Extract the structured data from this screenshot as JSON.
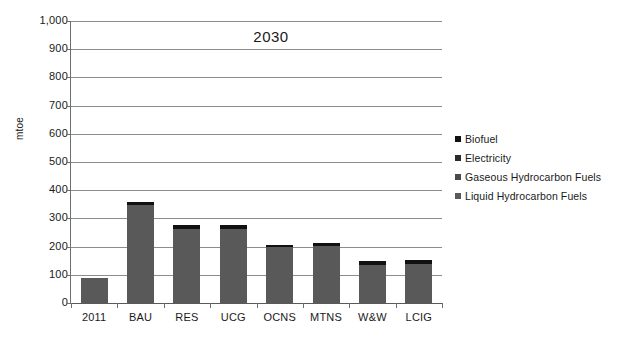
{
  "chart_data": {
    "type": "bar",
    "title": "2030",
    "xlabel": "",
    "ylabel": "mtoe",
    "ylim": [
      0,
      1000
    ],
    "ytick_step": 100,
    "grid": true,
    "legend_position": "right",
    "stacked": true,
    "categories": [
      "2011",
      "BAU",
      "RES",
      "UCG",
      "OCNS",
      "MTNS",
      "W&W",
      "LCIG"
    ],
    "ytick_labels": [
      "1,000",
      "900",
      "800",
      "700",
      "600",
      "500",
      "400",
      "300",
      "200",
      "100",
      "0"
    ],
    "ytick_values": [
      1000,
      900,
      800,
      700,
      600,
      500,
      400,
      300,
      200,
      100,
      0
    ],
    "series": [
      {
        "name": "Biofuel",
        "color": "#111111",
        "values": [
          0,
          10,
          14,
          14,
          7,
          9,
          12,
          12
        ]
      },
      {
        "name": "Electricity",
        "color": "#2b2b2b",
        "values": [
          0,
          0,
          0,
          0,
          0,
          0,
          0,
          0
        ]
      },
      {
        "name": "Gaseous Hydrocarbon Fuels",
        "color": "#4a4a4a",
        "values": [
          0,
          0,
          0,
          0,
          0,
          0,
          0,
          0
        ]
      },
      {
        "name": "Liquid Hydrocarbon Fuels",
        "color": "#595959",
        "values": [
          90,
          348,
          264,
          263,
          198,
          203,
          136,
          140
        ]
      }
    ],
    "totals": [
      90,
      358,
      278,
      277,
      205,
      212,
      148,
      152
    ],
    "legend": [
      "Biofuel",
      "Electricity",
      "Gaseous Hydrocarbon Fuels",
      "Liquid Hydrocarbon Fuels"
    ],
    "colors": {
      "biofuel": "#111111",
      "electricity": "#2b2b2b",
      "gaseous_hydrocarbon_fuels": "#4a4a4a",
      "liquid_hydrocarbon_fuels": "#595959",
      "gridline": "#8c8c8c",
      "axis": "#6e6e6e",
      "text": "#1a1a1a",
      "background": "#ffffff"
    }
  }
}
